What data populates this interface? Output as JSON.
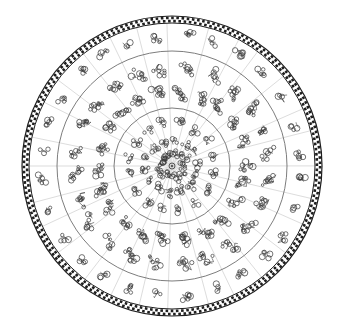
{
  "diagram": {
    "kind": "circular-star-map-volvelle",
    "canvas": {
      "width": 339,
      "height": 330,
      "background": "#ffffff"
    },
    "center": {
      "x": 172,
      "y": 166
    },
    "colors": {
      "ring_line": "#6e6e6e",
      "radial_line": "#c4c4c4",
      "glyph_ink": "#3a3a3a",
      "border_ink": "#1e1e1e"
    },
    "border": {
      "outer_radius": 150,
      "inner_radius": 143,
      "pattern": "checker-chain"
    },
    "rings": [
      {
        "name": "outer-ring",
        "radius": 115
      },
      {
        "name": "middle-ring",
        "radius": 58
      }
    ],
    "radial_line_count": 28,
    "bands": [
      {
        "name": "outer-band",
        "glyph_radius": [
          130
        ],
        "glyphs_per_row": 28,
        "glyph_size": 9
      },
      {
        "name": "middle-band",
        "glyph_radius": [
          100,
          76
        ],
        "glyphs_per_row": 24,
        "glyph_size": 9
      },
      {
        "name": "inner-disc",
        "glyph_radius": [
          44,
          26,
          12
        ],
        "glyphs_per_row": 16,
        "glyph_size": 8
      }
    ],
    "center_hub": {
      "radius": 3
    }
  }
}
